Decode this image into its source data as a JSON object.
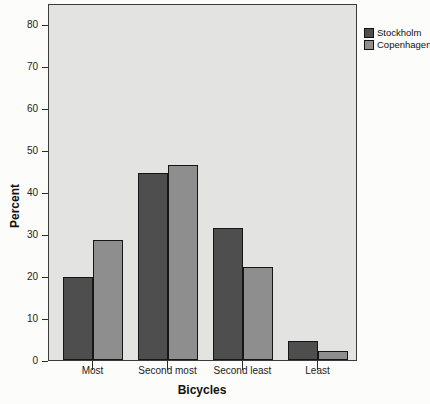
{
  "chart_data": {
    "type": "bar",
    "title": "",
    "xlabel": "Bicycles",
    "ylabel": "Percent",
    "categories": [
      "Most",
      "Second most",
      "Second least",
      "Least"
    ],
    "series": [
      {
        "name": "Stockholm",
        "color": "#4e4e4e",
        "values": [
          19.8,
          44.6,
          31.5,
          4.5
        ]
      },
      {
        "name": "Copenhagen",
        "color": "#8e8e8e",
        "values": [
          28.6,
          46.5,
          22.2,
          2.2
        ]
      }
    ],
    "ylim": [
      0,
      80
    ],
    "yticks": [
      0,
      10,
      20,
      30,
      40,
      50,
      60,
      70,
      80
    ],
    "grid": false,
    "legend_position": "top-right-outside",
    "plot_background": "#e3e3e1",
    "bar_border_color": "#161616",
    "frame_color": "#3c3c3c"
  }
}
